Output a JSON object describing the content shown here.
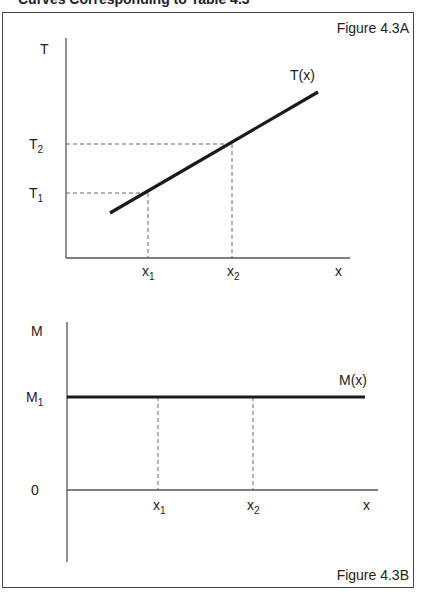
{
  "header": {
    "cut_title": "Curves Corresponding to Table 4.3"
  },
  "figure_a": {
    "caption": "Figure 4.3A",
    "y_axis_label": "T",
    "x_axis_label": "x",
    "curve_label": "T(x)",
    "y_ticks": [
      {
        "base": "T",
        "sub": "1"
      },
      {
        "base": "T",
        "sub": "2"
      }
    ],
    "x_ticks": [
      {
        "base": "x",
        "sub": "1"
      },
      {
        "base": "x",
        "sub": "2"
      }
    ]
  },
  "figure_b": {
    "caption": "Figure 4.3B",
    "y_axis_label": "M",
    "x_axis_label": "x",
    "curve_label": "M(x)",
    "origin_label": "0",
    "y_ticks": [
      {
        "base": "M",
        "sub": "1"
      }
    ],
    "x_ticks": [
      {
        "base": "x",
        "sub": "1"
      },
      {
        "base": "x",
        "sub": "2"
      }
    ]
  },
  "colors": {
    "line": "#1a1a1a",
    "axis": "#555555",
    "dashed": "#666666",
    "frame": "#444444"
  }
}
